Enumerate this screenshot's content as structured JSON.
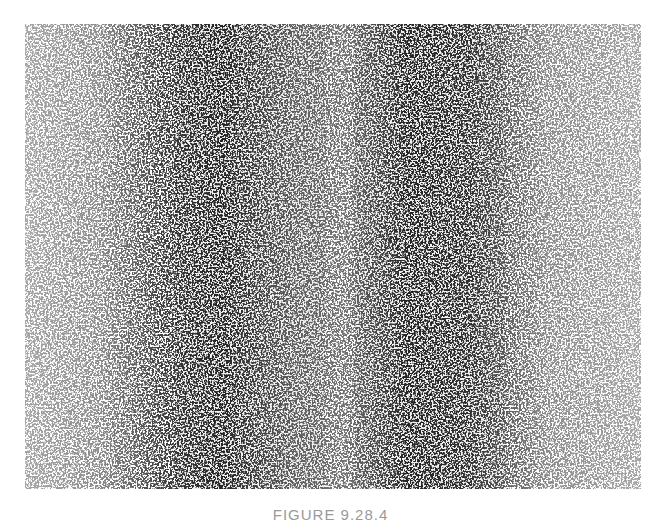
{
  "figure": {
    "colors": {
      "background": "#ffffff",
      "ink": "#2a2a2a"
    },
    "bands": [
      {
        "name": "left-band",
        "cx": 230,
        "width": 150
      },
      {
        "name": "right-band",
        "cx": 420,
        "width": 150
      }
    ]
  },
  "caption": {
    "text": "FIGURE 9.28.4"
  }
}
